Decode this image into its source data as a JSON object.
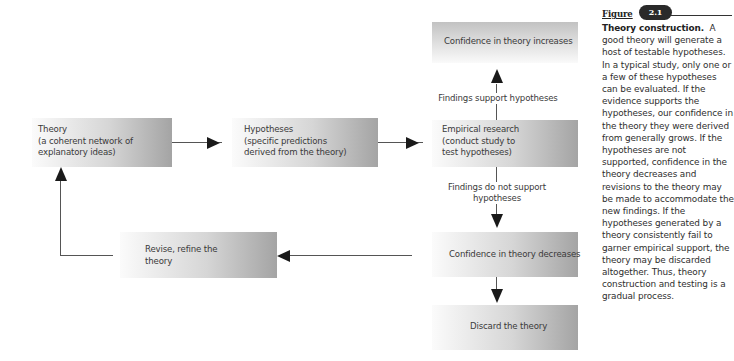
{
  "diagram": {
    "nodes": {
      "theory": {
        "line1": "Theory",
        "line2": "(a coherent network of",
        "line3": "explanatory ideas)"
      },
      "hypotheses": {
        "line1": "Hypotheses",
        "line2": "(specific predictions",
        "line3": "derived from the theory)"
      },
      "empirical": {
        "line1": "Empirical research",
        "line2": "(conduct study to",
        "line3": "test hypotheses)"
      },
      "increase": {
        "text": "Confidence in theory increases"
      },
      "decrease": {
        "text": "Confidence in theory decreases"
      },
      "discard": {
        "text": "Discard the theory"
      },
      "revise": {
        "line1": "Revise, refine the",
        "line2": "theory"
      }
    },
    "edges": {
      "support": "Findings support hypotheses",
      "not_support_line1": "Findings do not support",
      "not_support_line2": "hypotheses"
    }
  },
  "caption": {
    "figure_word": "Figure",
    "figure_number": "2.1",
    "title": "Theory construction.",
    "body": "A good theory will generate a host of testable hypotheses. In a typical study, only one or a few of these hypotheses can be evaluated. If the evidence supports the hypotheses, our confidence in the theory they were derived from generally grows. If the hypotheses are not supported, confidence in the theory decreases and revisions to the theory may be made to accommodate the new findings. If the hypotheses generated by a theory consistently fail to garner empirical support, the theory may be discarded altogether. Thus, theory construction and testing is a gradual process."
  }
}
